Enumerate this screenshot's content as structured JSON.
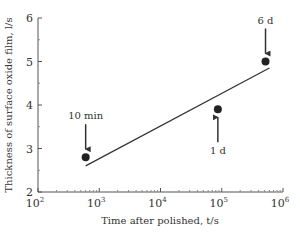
{
  "chart_data": {
    "type": "scatter",
    "title": "",
    "xlabel": "Time after polished, t/s",
    "ylabel": "Thickness of surface oxide film, l/s",
    "xscale": "log",
    "xlim": [
      100,
      1000000
    ],
    "ylim": [
      2,
      6
    ],
    "grid": false,
    "x_ticks": [
      {
        "value": 100,
        "base": "10",
        "exp": "2"
      },
      {
        "value": 1000,
        "base": "10",
        "exp": "3"
      },
      {
        "value": 10000,
        "base": "10",
        "exp": "4"
      },
      {
        "value": 100000,
        "base": "10",
        "exp": "5"
      },
      {
        "value": 1000000,
        "base": "10",
        "exp": "6"
      }
    ],
    "y_ticks": [
      "2",
      "3",
      "4",
      "5",
      "6"
    ],
    "points": [
      {
        "x": 600,
        "y": 2.8,
        "label": "10 min",
        "arrow": "down"
      },
      {
        "x": 86400,
        "y": 3.9,
        "label": "1 d",
        "arrow": "up"
      },
      {
        "x": 518400,
        "y": 5.0,
        "label": "6 d",
        "arrow": "down"
      }
    ],
    "fit_line": {
      "x": [
        600,
        600000
      ],
      "y": [
        2.6,
        4.85
      ]
    }
  }
}
